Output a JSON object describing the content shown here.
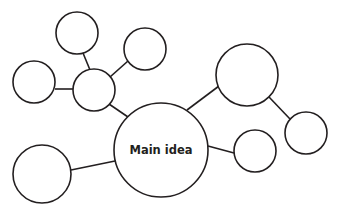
{
  "diagram": {
    "type": "bubble-map",
    "stroke_color": "#231f20",
    "background": "#ffffff",
    "main_node": {
      "label": "Main idea",
      "cx": 161,
      "cy": 150,
      "r": 47
    },
    "nodes": [
      {
        "id": "hub-left",
        "label": "",
        "cx": 94,
        "cy": 90,
        "r": 21
      },
      {
        "id": "top",
        "label": "",
        "cx": 77,
        "cy": 33,
        "r": 21
      },
      {
        "id": "upper-right-small",
        "label": "",
        "cx": 145,
        "cy": 49,
        "r": 21
      },
      {
        "id": "left",
        "label": "",
        "cx": 34,
        "cy": 82,
        "r": 21
      },
      {
        "id": "bottom-left",
        "label": "",
        "cx": 42,
        "cy": 174,
        "r": 29
      },
      {
        "id": "right-large",
        "label": "",
        "cx": 247,
        "cy": 75,
        "r": 31
      },
      {
        "id": "far-right",
        "label": "",
        "cx": 306,
        "cy": 133,
        "r": 21
      },
      {
        "id": "right-small",
        "label": "",
        "cx": 255,
        "cy": 151,
        "r": 21
      }
    ],
    "edges": [
      {
        "from": "main",
        "to": "hub-left"
      },
      {
        "from": "hub-left",
        "to": "top"
      },
      {
        "from": "hub-left",
        "to": "upper-right-small"
      },
      {
        "from": "hub-left",
        "to": "left"
      },
      {
        "from": "main",
        "to": "bottom-left"
      },
      {
        "from": "main",
        "to": "right-large"
      },
      {
        "from": "right-large",
        "to": "far-right"
      },
      {
        "from": "main",
        "to": "right-small"
      }
    ]
  }
}
